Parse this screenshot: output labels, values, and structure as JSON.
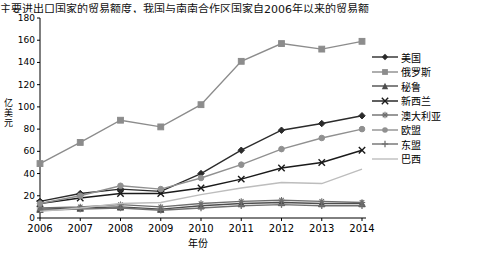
{
  "top_caption": "主要进出口国家的贸易额度，我国与南南合作区国家自2006年以来的贸易额",
  "chart_data": {
    "type": "line",
    "title": "",
    "xlabel": "年份",
    "ylabel": "亿美元",
    "categories": [
      "2006",
      "2007",
      "2008",
      "2009",
      "2010",
      "2011",
      "2012",
      "2013",
      "2014"
    ],
    "ylim": [
      0,
      180
    ],
    "yticks": [
      0,
      20,
      40,
      60,
      80,
      100,
      120,
      140,
      160,
      180
    ],
    "grid": false,
    "legend_position": "right",
    "series": [
      {
        "name": "美国",
        "color": "#2b2b2b",
        "marker": "diamond",
        "values": [
          15,
          22,
          26,
          24,
          40,
          61,
          79,
          85,
          92
        ]
      },
      {
        "name": "俄罗斯",
        "color": "#8c8c8c",
        "marker": "square",
        "values": [
          49,
          68,
          88,
          82,
          102,
          141,
          157,
          152,
          159
        ]
      },
      {
        "name": "秘鲁",
        "color": "#4d4d4d",
        "marker": "triangle",
        "values": [
          8,
          9,
          10,
          8,
          11,
          13,
          14,
          13,
          13
        ]
      },
      {
        "name": "新西兰",
        "color": "#1a1a1a",
        "marker": "cross",
        "values": [
          13,
          18,
          22,
          22,
          27,
          35,
          45,
          50,
          61
        ]
      },
      {
        "name": "澳大利亚",
        "color": "#6e6e6e",
        "marker": "star",
        "values": [
          9,
          10,
          12,
          10,
          13,
          15,
          16,
          15,
          14
        ]
      },
      {
        "name": "欧盟",
        "color": "#909090",
        "marker": "circle",
        "values": [
          13,
          20,
          29,
          26,
          36,
          48,
          62,
          72,
          80
        ]
      },
      {
        "name": "东盟",
        "color": "#707070",
        "marker": "plus",
        "values": [
          7,
          8,
          9,
          7,
          9,
          11,
          12,
          11,
          11
        ]
      },
      {
        "name": "巴西",
        "color": "#bdbdbd",
        "marker": "none",
        "values": [
          6,
          9,
          13,
          14,
          21,
          27,
          32,
          31,
          44
        ]
      }
    ]
  }
}
